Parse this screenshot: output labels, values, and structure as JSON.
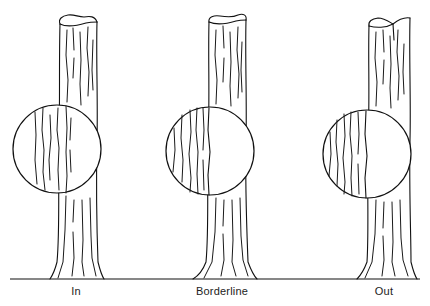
{
  "figure": {
    "ground_line": {
      "y": 279,
      "x_start": 10,
      "x_end": 420,
      "color": "#111111"
    },
    "panels": [
      {
        "label": "In",
        "label_x": 76,
        "tree": {
          "top_left": 58,
          "top_right": 97,
          "base_left": 50,
          "base_right": 103
        },
        "circle": {
          "cx": 57,
          "cy": 149,
          "r": 44
        }
      },
      {
        "label": "Borderline",
        "label_x": 222,
        "tree": {
          "top_left": 208,
          "top_right": 246,
          "base_left": 193,
          "base_right": 257
        },
        "circle": {
          "cx": 210,
          "cy": 151,
          "r": 44
        }
      },
      {
        "label": "Out",
        "label_x": 384,
        "tree": {
          "top_left": 368,
          "top_right": 410,
          "base_left": 357,
          "base_right": 417
        },
        "circle": {
          "cx": 367,
          "cy": 154,
          "r": 44
        }
      }
    ]
  }
}
